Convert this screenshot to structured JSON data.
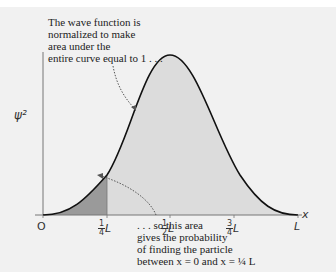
{
  "diagram": {
    "y_axis_label": "ψ²",
    "x_axis_label": "x",
    "ticks": [
      {
        "label": "O"
      },
      {
        "num": "1",
        "den": "4",
        "unit": "L"
      },
      {
        "num": "1",
        "den": "2",
        "unit": "L"
      },
      {
        "num": "3",
        "den": "4",
        "unit": "L"
      },
      {
        "label": "L"
      }
    ],
    "annotation_top": [
      "The wave function is",
      "normalized to make",
      "area under the",
      "entire curve equal to 1 . . ."
    ],
    "annotation_bottom": [
      ". . . so this area",
      "gives the probability",
      "of finding the particle",
      "between x = 0 and x = ¼ L"
    ],
    "colors": {
      "background": "#f1f1f1",
      "curve": "#111111",
      "area_fill": "#dcdcdc",
      "shaded_region": "#9a9a9a",
      "axis": "#666666"
    }
  }
}
